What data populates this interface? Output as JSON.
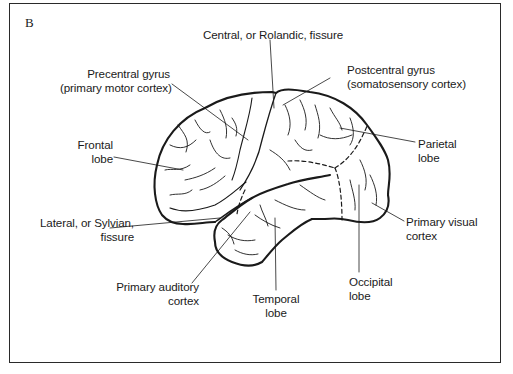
{
  "figure": {
    "panel_letter": "B",
    "labels": {
      "central_fissure": "Central, or Rolandic, fissure",
      "precentral_line1": "Precentral gyrus",
      "precentral_line2": "(primary motor cortex)",
      "postcentral_line1": "Postcentral gyrus",
      "postcentral_line2": "(somatosensory cortex)",
      "frontal_line1": "Frontal",
      "frontal_line2": "lobe",
      "parietal_line1": "Parietal",
      "parietal_line2": "lobe",
      "lateral_line1": "Lateral, or Sylvian,",
      "lateral_line2": "fissure",
      "visual_line1": "Primary visual",
      "visual_line2": "cortex",
      "auditory_line1": "Primary auditory",
      "auditory_line2": "cortex",
      "temporal_line1": "Temporal",
      "temporal_line2": "lobe",
      "occipital_line1": "Occipital",
      "occipital_line2": "lobe"
    },
    "colors": {
      "ink": "#1a1a1a",
      "background": "#ffffff"
    }
  }
}
